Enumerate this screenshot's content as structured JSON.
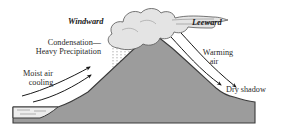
{
  "diagram": {
    "type": "orographic-rain-shadow",
    "labels": {
      "windward": "Windward",
      "leeward": "Leeward",
      "condensation_line1": "Condensation—",
      "condensation_line2": "Heavy Precipitation",
      "moist_air_line1": "Moist air",
      "moist_air_line2": "cooling",
      "warming_air_line1": "Warming",
      "warming_air_line2": "air",
      "dry_shadow": "Dry shadow"
    },
    "colors": {
      "ground": "#9c9c9c",
      "outline": "#3a3a3a",
      "cloud": "#e4e4e4",
      "water": "#ededed",
      "background": "#ffffff"
    }
  }
}
